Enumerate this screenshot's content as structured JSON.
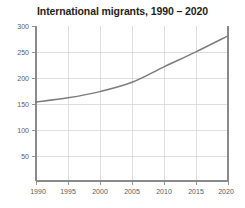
{
  "chart_data": {
    "type": "line",
    "title": "International migrants, 1990 – 2020",
    "xlabel": "",
    "ylabel": "",
    "x": [
      1990,
      1995,
      2000,
      2005,
      2010,
      2015,
      2020
    ],
    "categories": [
      "1990",
      "1995",
      "2000",
      "2005",
      "2010",
      "2015",
      "2020"
    ],
    "series": [
      {
        "name": "International migrants",
        "values": [
          153,
          161,
          173,
          191,
          221,
          250,
          281
        ]
      }
    ],
    "xlim": [
      1990,
      2020
    ],
    "ylim": [
      0,
      300
    ],
    "xticks": [
      1990,
      1995,
      2000,
      2005,
      2010,
      2015,
      2020
    ],
    "xtick_labels": [
      "1990",
      "1995",
      "2000",
      "2005",
      "2010",
      "2015",
      "2020"
    ],
    "yticks": [
      50,
      100,
      150,
      200,
      250,
      300
    ],
    "ytick_labels": [
      "50",
      "100",
      "150",
      "200",
      "250",
      "300"
    ],
    "grid": true,
    "grid_axes": "both",
    "legend": false,
    "legend_position": "none",
    "line_color": "#7d7d7d",
    "grid_color": "#d6d6d6",
    "axis_color": "#8a8a8a",
    "background_color": "#ffffff"
  }
}
